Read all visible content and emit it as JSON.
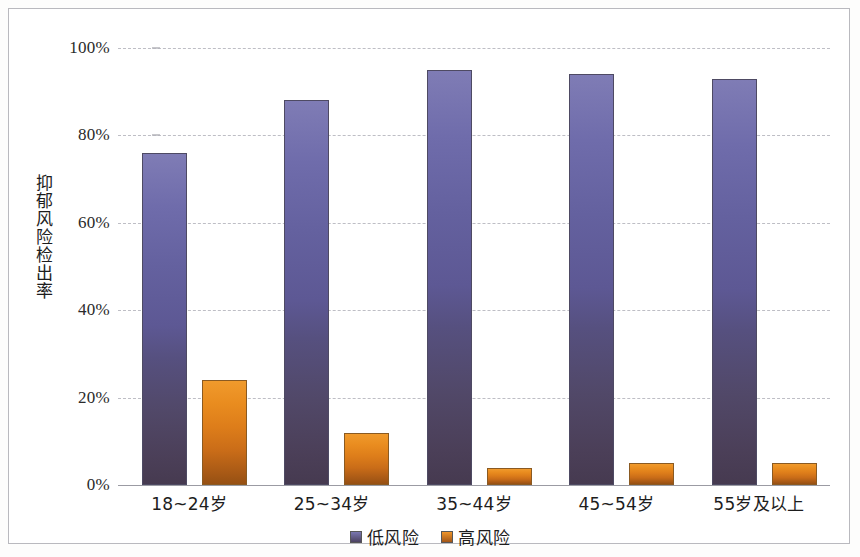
{
  "chart_data": {
    "type": "bar",
    "title": "",
    "subtitle": "",
    "xlabel": "",
    "ylabel": "抑郁风险检出率",
    "categories": [
      "18~24岁",
      "25~34岁",
      "35~44岁",
      "45~54岁",
      "55岁及以上"
    ],
    "series": [
      {
        "name": "低风险",
        "color": "#5d5894",
        "values": [
          76,
          88,
          95,
          94,
          93
        ],
        "value_labels": [
          "76%",
          "88%",
          "95%",
          "94%",
          "93%"
        ]
      },
      {
        "name": "高风险",
        "color": "#dd7d1a",
        "values": [
          24,
          12,
          4,
          5,
          5
        ],
        "value_labels": [
          "24%",
          "12%",
          "4%",
          "5%",
          "5%"
        ]
      }
    ],
    "ylim": [
      0,
      100
    ],
    "y_ticks": [
      0,
      20,
      40,
      60,
      80,
      100
    ],
    "y_tick_labels": [
      "0%",
      "20%",
      "40%",
      "60%",
      "80%",
      "100%"
    ],
    "grid": true,
    "grid_style": "dashed-horizontal",
    "legend_position": "bottom-center",
    "unit": "%"
  },
  "legend": {
    "entries": [
      {
        "label": "低风险",
        "swatch": "low"
      },
      {
        "label": "高风险",
        "swatch": "high"
      }
    ]
  }
}
